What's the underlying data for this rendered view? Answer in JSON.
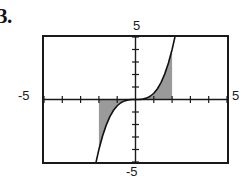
{
  "problem": {
    "label": "3."
  },
  "labels": {
    "top": "5",
    "left": "-5",
    "right": "5",
    "bottom": "-5"
  },
  "colors": {
    "frame": "#1a1a1a",
    "axis": "#1a1a1a",
    "curve": "#111111",
    "shade": "#9a9a9a",
    "background": "#ffffff",
    "text": "#111111"
  },
  "chart_data": {
    "type": "line",
    "title": "",
    "xlabel": "",
    "ylabel": "",
    "xlim": [
      -5,
      5
    ],
    "ylim": [
      -5,
      5
    ],
    "grid": false,
    "legend": null,
    "xticks": [
      -5,
      -4,
      -3,
      -2,
      -1,
      0,
      1,
      2,
      3,
      4,
      5
    ],
    "yticks": [
      -5,
      -4,
      -3,
      -2,
      -1,
      0,
      1,
      2,
      3,
      4,
      5
    ],
    "xtick_labels": [
      "-5",
      "",
      "",
      "",
      "",
      "",
      "",
      "",
      "",
      "",
      "5"
    ],
    "ytick_labels": [
      "-5",
      "",
      "",
      "",
      "",
      "",
      "",
      "",
      "",
      "",
      "5"
    ],
    "series": [
      {
        "name": "y = x^3/2",
        "kind": "curve",
        "x": [
          -2.15,
          -2.0,
          -1.8,
          -1.6,
          -1.4,
          -1.2,
          -1.0,
          -0.8,
          -0.6,
          -0.4,
          -0.2,
          0.0,
          0.2,
          0.4,
          0.6,
          0.8,
          1.0,
          1.2,
          1.4,
          1.6,
          1.8,
          2.0,
          2.15
        ],
        "y": [
          -4.97,
          -4.0,
          -2.92,
          -2.05,
          -1.37,
          -0.86,
          -0.5,
          -0.26,
          -0.11,
          -0.032,
          -0.004,
          0.0,
          0.004,
          0.032,
          0.11,
          0.26,
          0.5,
          0.86,
          1.37,
          2.05,
          2.92,
          4.0,
          4.97
        ]
      }
    ],
    "shaded_regions": [
      {
        "name": "left-region",
        "description": "region between curve and x-axis from x=-2 to x=0, below axis",
        "x_range": [
          -2,
          0
        ],
        "fill": "#9a9a9a"
      },
      {
        "name": "right-region",
        "description": "region between curve and x-axis from x=0 to x=2, above axis",
        "x_range": [
          0,
          2
        ],
        "fill": "#9a9a9a"
      }
    ]
  }
}
